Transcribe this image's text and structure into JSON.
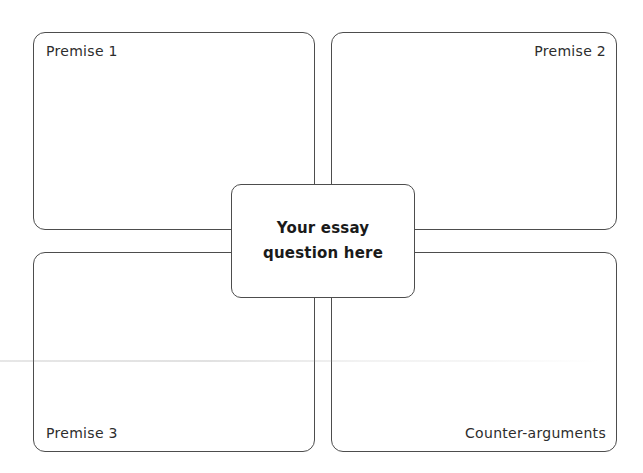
{
  "diagram": {
    "center": {
      "label": "Your essay question here",
      "lines": [
        "Your essay",
        "question here"
      ]
    },
    "quadrants": [
      {
        "id": "premise-1",
        "label": "Premise 1",
        "position": "top-left"
      },
      {
        "id": "premise-2",
        "label": "Premise 2",
        "position": "top-right"
      },
      {
        "id": "premise-3",
        "label": "Premise 3",
        "position": "bottom-left"
      },
      {
        "id": "counter-arguments",
        "label": "Counter-arguments",
        "position": "bottom-right"
      }
    ],
    "colors": {
      "border": "#4d4d4d",
      "label_text": "#2d2d2d",
      "center_text": "#1a1a1a",
      "background": "#ffffff"
    }
  }
}
